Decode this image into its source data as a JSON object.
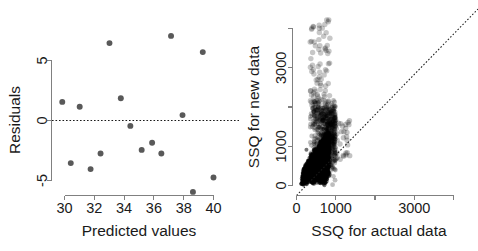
{
  "figure": {
    "background": "#ffffff",
    "panel_count": 2
  },
  "chart_data": [
    {
      "type": "scatter",
      "id": "residual-plot",
      "title": "",
      "xlabel": "Predicted values",
      "ylabel": "Residuals",
      "xlim": [
        29.5,
        40.3
      ],
      "ylim": [
        -6.6,
        7.6
      ],
      "xticks": [
        30,
        32,
        34,
        36,
        38,
        40
      ],
      "xticklabels": [
        "30",
        "32",
        "34",
        "36",
        "38",
        "40"
      ],
      "yticks": [
        -5,
        0,
        5
      ],
      "yticklabels": [
        "-5",
        "0",
        "5"
      ],
      "grid": false,
      "legend": null,
      "point_color": "#595959",
      "point_size": 4.6,
      "annotations": [
        {
          "type": "hline",
          "y": 0,
          "style": "dotted",
          "color": "#1a1a1a"
        }
      ],
      "points": [
        {
          "x": 29.85,
          "y": 1.55
        },
        {
          "x": 30.42,
          "y": -3.55
        },
        {
          "x": 31.02,
          "y": 1.15
        },
        {
          "x": 31.75,
          "y": -4.05
        },
        {
          "x": 32.42,
          "y": -2.75
        },
        {
          "x": 33.02,
          "y": 6.45
        },
        {
          "x": 33.78,
          "y": 1.85
        },
        {
          "x": 34.42,
          "y": -0.45
        },
        {
          "x": 35.18,
          "y": -2.45
        },
        {
          "x": 35.88,
          "y": -1.85
        },
        {
          "x": 36.5,
          "y": -2.75
        },
        {
          "x": 37.15,
          "y": 7.05
        },
        {
          "x": 37.92,
          "y": 0.45
        },
        {
          "x": 38.62,
          "y": -5.95
        },
        {
          "x": 39.28,
          "y": 5.7
        },
        {
          "x": 40.0,
          "y": -4.75
        }
      ]
    },
    {
      "type": "scatter",
      "id": "ssq-plot",
      "title": "",
      "xlabel": "SSQ for actual data",
      "ylabel": "SSQ for new data",
      "xlim": [
        -120,
        4550
      ],
      "ylim": [
        -150,
        4700
      ],
      "xticks": [
        0,
        1000,
        2000,
        3000,
        4000
      ],
      "xticklabels": [
        "0",
        "1000",
        "",
        "3000",
        ""
      ],
      "yticks": [
        0,
        1000,
        2000,
        3000,
        4000
      ],
      "yticklabels": [
        "0",
        "1000",
        "",
        "3000",
        ""
      ],
      "grid": false,
      "legend": null,
      "point_color": "#000000",
      "point_alpha": 0.28,
      "point_size": 3.0,
      "annotations": [
        {
          "type": "abline",
          "slope": 1,
          "intercept": 0,
          "style": "dotted",
          "color": "#1a1a1a",
          "label": "y = x identity line"
        }
      ],
      "description": "Dense near-solid black cloud of simulated points rising steeply from the origin, concentrated between x = 150 and x = 900 with y ranging 0 to about 1900, plus a sparse tail of lighter gray outliers extending upward to y of about 4300 and rightward to x of about 1300. The vast majority of points fall above the identity line.",
      "cloud": {
        "x_range": [
          120,
          950
        ],
        "y_dense_range": [
          0,
          1900
        ],
        "outlier_y_max": 4350,
        "outlier_x_max": 1350,
        "n_points_approx": 5000
      }
    }
  ]
}
